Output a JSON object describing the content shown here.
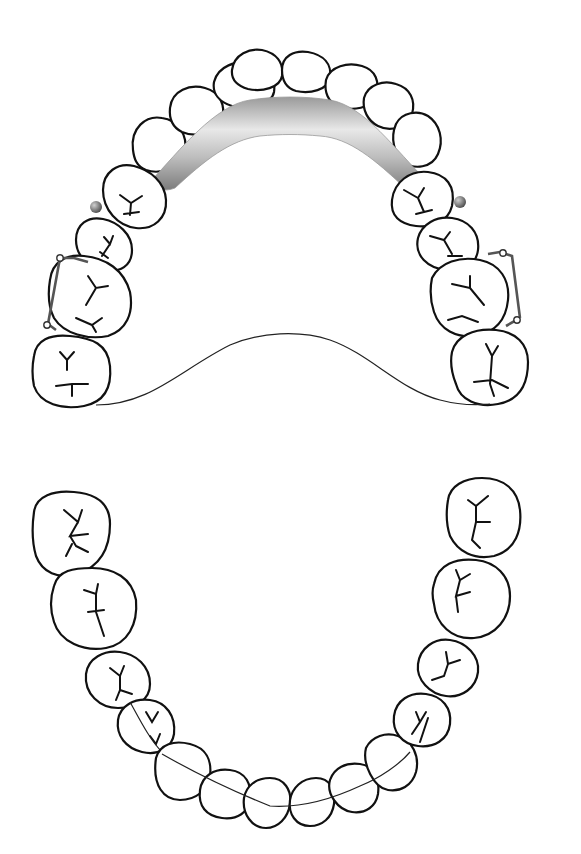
{
  "figure": {
    "title": "",
    "colors": {
      "background": "#ffffff",
      "outline": "#111111",
      "bar_light": "#e6e6e6",
      "bar_dark": "#8a8a8a",
      "rest_ball": "#6f6f6f"
    }
  },
  "upper_arch": {
    "label": "",
    "components": [
      "anterior-palatal-bar",
      "left-ball-rest",
      "right-ball-rest",
      "left-clasp",
      "right-clasp",
      "posterior-palatal-border"
    ]
  },
  "lower_arch": {
    "label": ""
  }
}
